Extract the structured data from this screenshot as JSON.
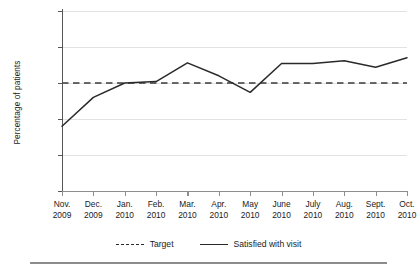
{
  "chart_data": {
    "type": "line",
    "title": "",
    "xlabel": "",
    "ylabel": "Percentage of patients",
    "ylim": [
      75,
      100
    ],
    "yticks": [
      75,
      80,
      85,
      90,
      95,
      100
    ],
    "grid": true,
    "legend_position": "bottom-center",
    "categories": [
      "Nov. 2009",
      "Dec. 2009",
      "Jan. 2010",
      "Feb. 2010",
      "Mar. 2010",
      "Apr. 2010",
      "May 2010",
      "June 2010",
      "July 2010",
      "Aug. 2010",
      "Sept. 2010",
      "Oct. 2010"
    ],
    "category_lines": [
      [
        "Nov.",
        "2009"
      ],
      [
        "Dec.",
        "2009"
      ],
      [
        "Jan.",
        "2010"
      ],
      [
        "Feb.",
        "2010"
      ],
      [
        "Mar.",
        "2010"
      ],
      [
        "Apr.",
        "2010"
      ],
      [
        "May",
        "2010"
      ],
      [
        "June",
        "2010"
      ],
      [
        "July",
        "2010"
      ],
      [
        "Aug.",
        "2010"
      ],
      [
        "Sept.",
        "2010"
      ],
      [
        "Oct.",
        "2010"
      ]
    ],
    "series": [
      {
        "name": "Satisfied with visit",
        "style": "solid",
        "color": "#2a2a2a",
        "values": [
          84.0,
          88.0,
          90.0,
          90.2,
          92.8,
          91.0,
          88.7,
          92.7,
          92.7,
          93.1,
          92.2,
          93.5
        ]
      },
      {
        "name": "Target",
        "style": "dashed",
        "color": "#3a3a3a",
        "constant": 90
      }
    ]
  },
  "legend": {
    "target_label": "Target",
    "series_label": "Satisfied with visit"
  }
}
